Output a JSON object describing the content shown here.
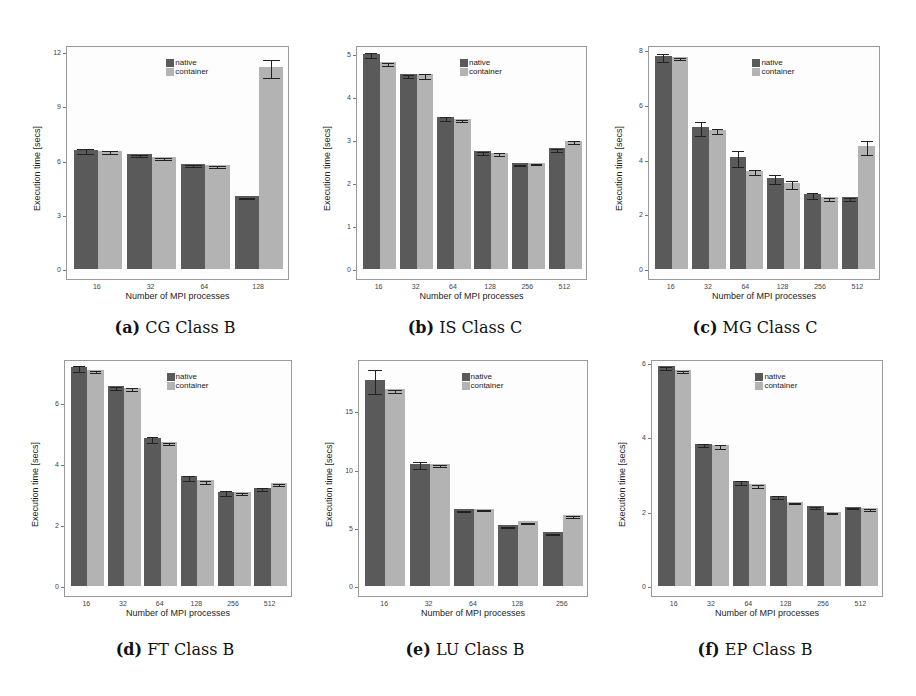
{
  "legend": {
    "native": "native",
    "container": "container"
  },
  "colors": {
    "native": "#5a5a5a",
    "container": "#b3b3b3",
    "errorbar": "#222222"
  },
  "xlabel": "Number of MPI processes",
  "ylabel": "Execution time [secs]",
  "captions": [
    {
      "tag": "(a)",
      "text": "CG Class B"
    },
    {
      "tag": "(b)",
      "text": "IS Class C"
    },
    {
      "tag": "(c)",
      "text": "MG Class C"
    },
    {
      "tag": "(d)",
      "text": "FT Class B"
    },
    {
      "tag": "(e)",
      "text": "LU Class B"
    },
    {
      "tag": "(f)",
      "text": "EP Class B"
    }
  ],
  "chart_data": [
    {
      "type": "bar",
      "title": "(a) CG Class B",
      "xlabel": "Number of MPI processes",
      "ylabel": "Execution time [secs]",
      "categories": [
        "16",
        "32",
        "64",
        "128"
      ],
      "series": [
        {
          "name": "native",
          "values": [
            6.6,
            6.35,
            5.82,
            4.02
          ],
          "err": [
            0.15,
            0.05,
            0.05,
            0.03
          ]
        },
        {
          "name": "container",
          "values": [
            6.55,
            6.2,
            5.75,
            11.2
          ],
          "err": [
            0.1,
            0.05,
            0.05,
            0.5
          ]
        }
      ],
      "yticks": [
        0,
        3,
        6,
        9,
        12
      ],
      "ylim": [
        0,
        12.4
      ],
      "legend_position": "top-center-right",
      "grid": false
    },
    {
      "type": "bar",
      "title": "(b) IS Class C",
      "xlabel": "Number of MPI processes",
      "ylabel": "Execution time [secs]",
      "categories": [
        "16",
        "32",
        "64",
        "128",
        "256",
        "512"
      ],
      "series": [
        {
          "name": "native",
          "values": [
            5.0,
            4.52,
            3.53,
            2.73,
            2.45,
            2.8
          ],
          "err": [
            0.06,
            0.04,
            0.04,
            0.03,
            0.02,
            0.04
          ]
        },
        {
          "name": "container",
          "values": [
            4.8,
            4.52,
            3.48,
            2.7,
            2.47,
            2.98
          ],
          "err": [
            0.03,
            0.06,
            0.03,
            0.04,
            0.02,
            0.03
          ]
        }
      ],
      "yticks": [
        0,
        1,
        2,
        3,
        4,
        5
      ],
      "ylim": [
        0,
        5.2
      ],
      "legend_position": "top-center-right",
      "grid": false
    },
    {
      "type": "bar",
      "title": "(c) MG Class C",
      "xlabel": "Number of MPI processes",
      "ylabel": "Execution time [secs]",
      "categories": [
        "16",
        "32",
        "64",
        "128",
        "256",
        "512"
      ],
      "series": [
        {
          "name": "native",
          "values": [
            7.8,
            5.2,
            4.1,
            3.35,
            2.75,
            2.62
          ],
          "err": [
            0.15,
            0.25,
            0.28,
            0.15,
            0.1,
            0.06
          ]
        },
        {
          "name": "container",
          "values": [
            7.75,
            5.1,
            3.6,
            3.15,
            2.62,
            4.5
          ],
          "err": [
            0.04,
            0.1,
            0.1,
            0.15,
            0.05,
            0.25
          ]
        }
      ],
      "yticks": [
        0,
        2,
        4,
        6,
        8
      ],
      "ylim": [
        0,
        8.2
      ],
      "legend_position": "top-center-right",
      "grid": false
    },
    {
      "type": "bar",
      "title": "(d) FT Class B",
      "xlabel": "Number of MPI processes",
      "ylabel": "Execution time [secs]",
      "categories": [
        "16",
        "32",
        "64",
        "128",
        "256",
        "512"
      ],
      "series": [
        {
          "name": "native",
          "values": [
            7.2,
            6.55,
            4.85,
            3.6,
            3.1,
            3.22
          ],
          "err": [
            0.1,
            0.04,
            0.1,
            0.08,
            0.07,
            0.05
          ]
        },
        {
          "name": "container",
          "values": [
            7.1,
            6.5,
            4.72,
            3.47,
            3.08,
            3.38
          ],
          "err": [
            0.03,
            0.05,
            0.03,
            0.05,
            0.03,
            0.04
          ]
        }
      ],
      "yticks": [
        0,
        2,
        4,
        6
      ],
      "ylim": [
        0,
        7.45
      ],
      "legend_position": "top-center-right",
      "grid": false
    },
    {
      "type": "bar",
      "title": "(e) LU Class B",
      "xlabel": "Number of MPI processes",
      "ylabel": "Execution time [secs]",
      "categories": [
        "16",
        "32",
        "64",
        "128",
        "256"
      ],
      "series": [
        {
          "name": "native",
          "values": [
            17.7,
            10.5,
            6.6,
            5.2,
            4.6
          ],
          "err": [
            1.0,
            0.3,
            0.05,
            0.05,
            0.05
          ]
        },
        {
          "name": "container",
          "values": [
            16.9,
            10.5,
            6.65,
            5.55,
            6.1
          ],
          "err": [
            0.15,
            0.1,
            0.05,
            0.05,
            0.05
          ]
        }
      ],
      "yticks": [
        0,
        5,
        10,
        15
      ],
      "ylim": [
        0,
        19.5
      ],
      "legend_position": "top-center-right",
      "grid": false
    },
    {
      "type": "bar",
      "title": "(f) EP Class B",
      "xlabel": "Number of MPI processes",
      "ylabel": "Execution time [secs]",
      "categories": [
        "16",
        "32",
        "64",
        "128",
        "256",
        "512"
      ],
      "series": [
        {
          "name": "native",
          "values": [
            5.9,
            3.82,
            2.82,
            2.42,
            2.15,
            2.13
          ],
          "err": [
            0.05,
            0.04,
            0.05,
            0.04,
            0.03,
            0.02
          ]
        },
        {
          "name": "container",
          "values": [
            5.8,
            3.78,
            2.73,
            2.27,
            2.0,
            2.1
          ],
          "err": [
            0.03,
            0.05,
            0.03,
            0.02,
            0.02,
            0.02
          ]
        }
      ],
      "yticks": [
        0,
        2,
        4,
        6
      ],
      "ylim": [
        0,
        6.1
      ],
      "legend_position": "top-center-right",
      "grid": false
    }
  ]
}
